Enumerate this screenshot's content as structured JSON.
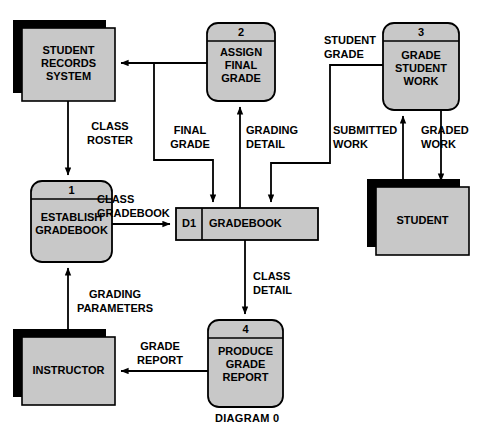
{
  "diagram": {
    "title": "DIAGRAM 0",
    "colors": {
      "fill": "#c8c8c8",
      "stroke": "#000000",
      "shadow": "#000000",
      "background": "#ffffff",
      "text": "#000000"
    },
    "processes": [
      {
        "id": "1",
        "number": "1",
        "label": "ESTABLISH\nGRADEBOOK"
      },
      {
        "id": "2",
        "number": "2",
        "label": "ASSIGN\nFINAL\nGRADE"
      },
      {
        "id": "3",
        "number": "3",
        "label": "GRADE\nSTUDENT\nWORK"
      },
      {
        "id": "4",
        "number": "4",
        "label": "PRODUCE\nGRADE\nREPORT"
      }
    ],
    "entities": [
      {
        "id": "student-records-system",
        "label": "STUDENT\nRECORDS\nSYSTEM"
      },
      {
        "id": "instructor",
        "label": "INSTRUCTOR"
      },
      {
        "id": "student",
        "label": "STUDENT"
      }
    ],
    "datastores": [
      {
        "id": "D1",
        "code": "D1",
        "label": "GRADEBOOK"
      }
    ],
    "flows": [
      {
        "id": "class-roster",
        "label": "CLASS\nROSTER",
        "from": "student-records-system",
        "to": "1"
      },
      {
        "id": "final-grade",
        "label": "FINAL\nGRADE",
        "from": "2",
        "to": "student-records-system"
      },
      {
        "id": "grading-detail",
        "label": "GRADING\nDETAIL",
        "from": "D1",
        "to": "2"
      },
      {
        "id": "student-grade",
        "label": "STUDENT\nGRADE",
        "from": "3",
        "to": "D1"
      },
      {
        "id": "submitted-work",
        "label": "SUBMITTED\nWORK",
        "from": "student",
        "to": "3"
      },
      {
        "id": "graded-work",
        "label": "GRADED\nWORK",
        "from": "3",
        "to": "student"
      },
      {
        "id": "class-gradebook",
        "label": "CLASS\nGRADEBOOK",
        "from": "1",
        "to": "D1"
      },
      {
        "id": "grading-parameters",
        "label": "GRADING\nPARAMETERS",
        "from": "instructor",
        "to": "1"
      },
      {
        "id": "class-detail",
        "label": "CLASS\nDETAIL",
        "from": "D1",
        "to": "4"
      },
      {
        "id": "grade-report",
        "label": "GRADE\nREPORT",
        "from": "4",
        "to": "instructor"
      }
    ]
  }
}
